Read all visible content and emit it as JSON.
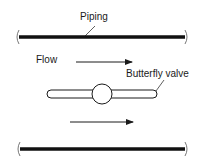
{
  "diagram": {
    "labels": {
      "piping": "Piping",
      "flow": "Flow",
      "valve": "Butterfly valve"
    },
    "colors": {
      "line": "#1a1a1a",
      "pipe": "#111111",
      "background": "#ffffff"
    }
  }
}
